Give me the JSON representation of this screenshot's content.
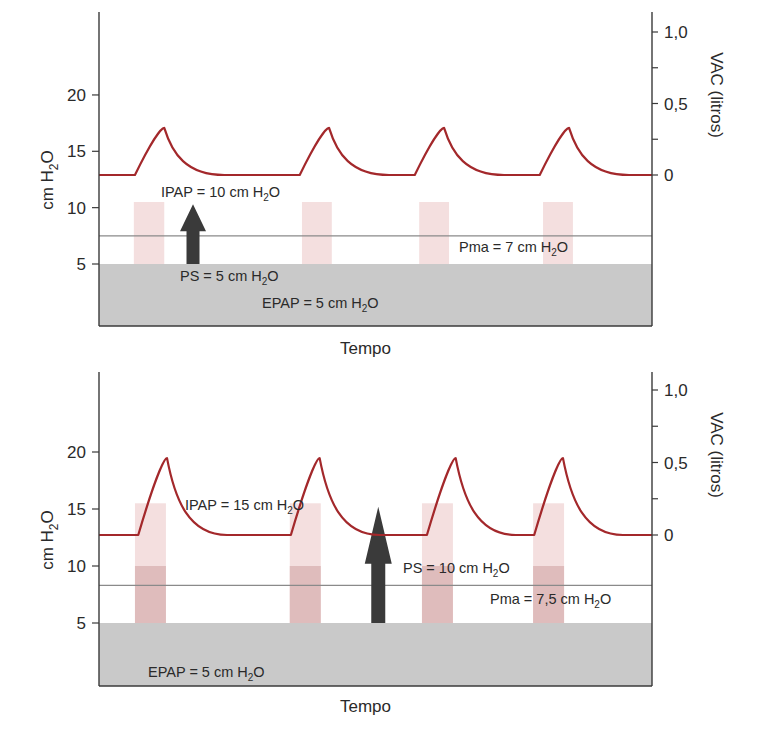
{
  "chart_data": [
    {
      "type": "line",
      "panel": "top",
      "title": "",
      "xlabel": "Tempo",
      "ylabel_left": "cm H2O",
      "ylabel_right": "VAC (litros)",
      "ylim_left": [
        0,
        25
      ],
      "ylim_right": [
        -1.0,
        1.15
      ],
      "yticks_left": [
        5,
        10,
        15,
        20
      ],
      "yticks_left_labels": [
        "5",
        "10",
        "15",
        "20"
      ],
      "yticks_right": [
        0,
        0.25,
        0.5,
        0.75,
        1.0
      ],
      "yticks_right_labels": [
        "0",
        "",
        "0,5",
        "",
        "1,0"
      ],
      "xlim": [
        0,
        100
      ],
      "grid": false,
      "epap_cmH2O": 5,
      "ipap_cmH2O": 10,
      "ps_cmH2O": 5,
      "pma_cmH2O": 7,
      "pma_line_cmH2O": 7.5,
      "inspiratory_bars": [
        {
          "x_start": 6.3,
          "x_end": 11.8,
          "from": 5,
          "to": 10.5
        },
        {
          "x_start": 36.7,
          "x_end": 42.1,
          "from": 5,
          "to": 10.5
        },
        {
          "x_start": 57.9,
          "x_end": 63.3,
          "from": 5,
          "to": 10.5
        },
        {
          "x_start": 80.3,
          "x_end": 85.7,
          "from": 5,
          "to": 10.5
        }
      ],
      "series": [
        {
          "name": "VAC (litros)",
          "axis": "right",
          "color": "#a3282b",
          "breaths": [
            {
              "rise_start": 6.5,
              "peak_x": 11.8,
              "peak_value": 0.33
            },
            {
              "rise_start": 36.3,
              "peak_x": 41.6,
              "peak_value": 0.33
            },
            {
              "rise_start": 57.1,
              "peak_x": 62.4,
              "peak_value": 0.33
            },
            {
              "rise_start": 79.7,
              "peak_x": 85.0,
              "peak_value": 0.33
            }
          ],
          "baseline_value": 0
        }
      ],
      "arrow": {
        "x": 17.0,
        "from": 5,
        "to": 10.3,
        "label": "PS = 5 cm H2O"
      },
      "annotations": [
        {
          "id": "ipap",
          "text": "IPAP = 10 cm H",
          "sub": "2",
          "tail": "O",
          "x": 161,
          "y": 197
        },
        {
          "id": "ps",
          "text": "PS = 5 cm H",
          "sub": "2",
          "tail": "O",
          "x": 180,
          "y": 281
        },
        {
          "id": "epap",
          "text": "EPAP = 5 cm H",
          "sub": "2",
          "tail": "O",
          "x": 262,
          "y": 308
        },
        {
          "id": "pma",
          "text": "Pma = 7 cm H",
          "sub": "2",
          "tail": "O",
          "x": 459,
          "y": 252
        }
      ]
    },
    {
      "type": "line",
      "panel": "bottom",
      "title": "",
      "xlabel": "Tempo",
      "ylabel_left": "cm H2O",
      "ylabel_right": "VAC (litros)",
      "ylim_left": [
        0,
        25
      ],
      "ylim_right": [
        -1.0,
        1.15
      ],
      "yticks_left": [
        5,
        10,
        15,
        20
      ],
      "yticks_left_labels": [
        "5",
        "10",
        "15",
        "20"
      ],
      "yticks_right": [
        0,
        0.25,
        0.5,
        0.75,
        1.0
      ],
      "yticks_right_labels": [
        "0",
        "",
        "0,5",
        "",
        "1,0"
      ],
      "xlim": [
        0,
        100
      ],
      "grid": false,
      "epap_cmH2O": 5,
      "ipap_cmH2O": 15,
      "ps_cmH2O": 10,
      "pma_cmH2O": 7.5,
      "pma_line_cmH2O": 8.3,
      "inspiratory_bars": [
        {
          "x_start": 6.5,
          "x_end": 12.1,
          "from": 5,
          "to": 15.5,
          "dark_to": 10
        },
        {
          "x_start": 34.5,
          "x_end": 40.1,
          "from": 5,
          "to": 15.5,
          "dark_to": 10
        },
        {
          "x_start": 58.4,
          "x_end": 64.0,
          "from": 5,
          "to": 15.5,
          "dark_to": 10
        },
        {
          "x_start": 78.5,
          "x_end": 84.1,
          "from": 5,
          "to": 15.5,
          "dark_to": 10
        }
      ],
      "series": [
        {
          "name": "VAC (litros)",
          "axis": "right",
          "color": "#a3282b",
          "breaths": [
            {
              "rise_start": 7.1,
              "peak_x": 12.3,
              "peak_value": 0.53
            },
            {
              "rise_start": 34.7,
              "peak_x": 39.9,
              "peak_value": 0.53
            },
            {
              "rise_start": 59.3,
              "peak_x": 64.5,
              "peak_value": 0.53
            },
            {
              "rise_start": 78.7,
              "peak_x": 83.9,
              "peak_value": 0.53
            }
          ],
          "baseline_value": 0
        }
      ],
      "arrow": {
        "x": 50.5,
        "from": 5,
        "to": 15.2,
        "label": "PS = 10 cm H2O"
      },
      "annotations": [
        {
          "id": "ipap",
          "text": "IPAP = 15 cm H",
          "sub": "2",
          "tail": "O",
          "x": 185,
          "y": 510
        },
        {
          "id": "ps",
          "text": "PS = 10 cm H",
          "sub": "2",
          "tail": "O",
          "x": 403,
          "y": 573
        },
        {
          "id": "pma",
          "text": "Pma = 7,5 cm H",
          "sub": "2",
          "tail": "O",
          "x": 490,
          "y": 604
        },
        {
          "id": "epap",
          "text": "EPAP = 5 cm H",
          "sub": "2",
          "tail": "O",
          "x": 148,
          "y": 677
        }
      ]
    }
  ],
  "colors": {
    "curve": "#a3282b",
    "epap_fill": "#c9c9c9",
    "bar_light": "#f4dfdf",
    "bar_dark": "#dfbcbc",
    "arrow": "#3a3a3a",
    "pma_line": "#8a8a8a",
    "axis": "#3a3a3a",
    "text": "#2a2a2a"
  }
}
